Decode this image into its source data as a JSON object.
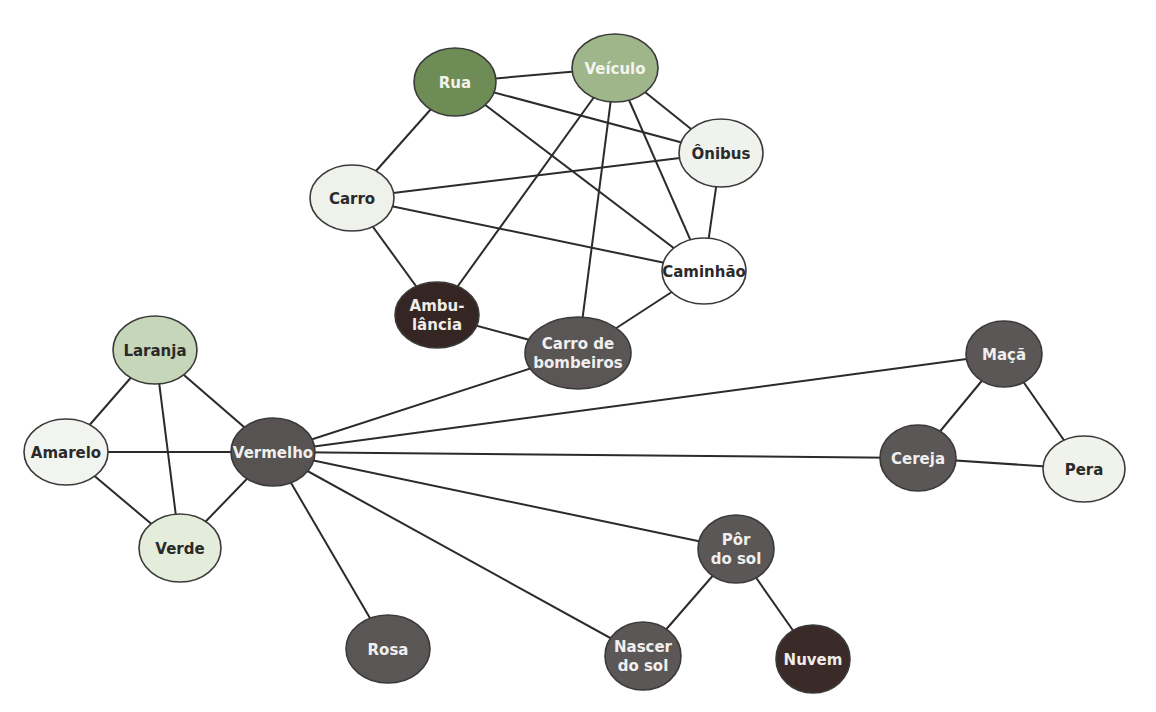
{
  "diagram": {
    "type": "semantic-network",
    "nodes": [
      {
        "id": "rua",
        "lines": [
          "Rua"
        ],
        "x": 455,
        "y": 82,
        "rx": 41,
        "ry": 34,
        "fill": "#6e8c56",
        "text": "#f2f2ec"
      },
      {
        "id": "veiculo",
        "lines": [
          "Veículo"
        ],
        "x": 615,
        "y": 68,
        "rx": 43,
        "ry": 34,
        "fill": "#9fb58a",
        "text": "#f4f4ee"
      },
      {
        "id": "onibus",
        "lines": [
          "Ônibus"
        ],
        "x": 721,
        "y": 153,
        "rx": 42,
        "ry": 34,
        "fill": "#f0f2ee",
        "text": "#2a2a2a"
      },
      {
        "id": "carro",
        "lines": [
          "Carro"
        ],
        "x": 352,
        "y": 198,
        "rx": 42,
        "ry": 33,
        "fill": "#eef2ea",
        "text": "#2a2a2a"
      },
      {
        "id": "caminhao",
        "lines": [
          "Caminhão"
        ],
        "x": 704,
        "y": 271,
        "rx": 42,
        "ry": 33,
        "fill": "#ffffff",
        "text": "#2a2a2a"
      },
      {
        "id": "ambulancia",
        "lines": [
          "Ambu-",
          "lância"
        ],
        "x": 437,
        "y": 315,
        "rx": 42,
        "ry": 33,
        "fill": "#352624",
        "text": "#f0ece8"
      },
      {
        "id": "carro_bombeiros",
        "lines": [
          "Carro de",
          "bombeiros"
        ],
        "x": 578,
        "y": 353,
        "rx": 53,
        "ry": 36,
        "fill": "#5a5655",
        "text": "#f0efee"
      },
      {
        "id": "laranja",
        "lines": [
          "Laranja"
        ],
        "x": 155,
        "y": 350,
        "rx": 42,
        "ry": 34,
        "fill": "#c6d6b8",
        "text": "#2a2a2a"
      },
      {
        "id": "amarelo",
        "lines": [
          "Amarelo"
        ],
        "x": 66,
        "y": 452,
        "rx": 42,
        "ry": 33,
        "fill": "#f2f4f0",
        "text": "#2a2a2a"
      },
      {
        "id": "vermelho",
        "lines": [
          "Vermelho"
        ],
        "x": 273,
        "y": 452,
        "rx": 42,
        "ry": 34,
        "fill": "#565352",
        "text": "#f0efee"
      },
      {
        "id": "verde",
        "lines": [
          "Verde"
        ],
        "x": 180,
        "y": 548,
        "rx": 41,
        "ry": 34,
        "fill": "#e4ecdc",
        "text": "#2a2a2a"
      },
      {
        "id": "rosa",
        "lines": [
          "Rosa"
        ],
        "x": 388,
        "y": 649,
        "rx": 42,
        "ry": 34,
        "fill": "#595655",
        "text": "#f0efee"
      },
      {
        "id": "maca",
        "lines": [
          "Maçã"
        ],
        "x": 1004,
        "y": 354,
        "rx": 38,
        "ry": 33,
        "fill": "#5a5756",
        "text": "#f0efee"
      },
      {
        "id": "cereja",
        "lines": [
          "Cereja"
        ],
        "x": 918,
        "y": 458,
        "rx": 38,
        "ry": 33,
        "fill": "#5a5756",
        "text": "#f0efee"
      },
      {
        "id": "pera",
        "lines": [
          "Pera"
        ],
        "x": 1084,
        "y": 469,
        "rx": 41,
        "ry": 33,
        "fill": "#f0f3ec",
        "text": "#2a2a2a"
      },
      {
        "id": "por_do_sol",
        "lines": [
          "Pôr",
          "do sol"
        ],
        "x": 736,
        "y": 549,
        "rx": 38,
        "ry": 34,
        "fill": "#5a5756",
        "text": "#f0efee"
      },
      {
        "id": "nascer_do_sol",
        "lines": [
          "Nascer",
          "do sol"
        ],
        "x": 643,
        "y": 656,
        "rx": 38,
        "ry": 34,
        "fill": "#5a5756",
        "text": "#f0efee"
      },
      {
        "id": "nuvem",
        "lines": [
          "Nuvem"
        ],
        "x": 813,
        "y": 659,
        "rx": 37,
        "ry": 34,
        "fill": "#3a2a28",
        "text": "#f0ece8"
      }
    ],
    "edges": [
      [
        "rua",
        "veiculo"
      ],
      [
        "rua",
        "onibus"
      ],
      [
        "rua",
        "caminhao"
      ],
      [
        "rua",
        "carro"
      ],
      [
        "veiculo",
        "onibus"
      ],
      [
        "veiculo",
        "caminhao"
      ],
      [
        "veiculo",
        "ambulancia"
      ],
      [
        "veiculo",
        "carro_bombeiros"
      ],
      [
        "carro",
        "onibus"
      ],
      [
        "carro",
        "caminhao"
      ],
      [
        "carro",
        "ambulancia"
      ],
      [
        "onibus",
        "caminhao"
      ],
      [
        "caminhao",
        "carro_bombeiros"
      ],
      [
        "ambulancia",
        "carro_bombeiros"
      ],
      [
        "carro_bombeiros",
        "vermelho"
      ],
      [
        "laranja",
        "amarelo"
      ],
      [
        "laranja",
        "verde"
      ],
      [
        "laranja",
        "vermelho"
      ],
      [
        "amarelo",
        "vermelho"
      ],
      [
        "amarelo",
        "verde"
      ],
      [
        "verde",
        "vermelho"
      ],
      [
        "vermelho",
        "rosa"
      ],
      [
        "vermelho",
        "maca"
      ],
      [
        "vermelho",
        "cereja"
      ],
      [
        "vermelho",
        "por_do_sol"
      ],
      [
        "vermelho",
        "nascer_do_sol"
      ],
      [
        "maca",
        "cereja"
      ],
      [
        "maca",
        "pera"
      ],
      [
        "cereja",
        "pera"
      ],
      [
        "por_do_sol",
        "nascer_do_sol"
      ],
      [
        "por_do_sol",
        "nuvem"
      ]
    ]
  }
}
